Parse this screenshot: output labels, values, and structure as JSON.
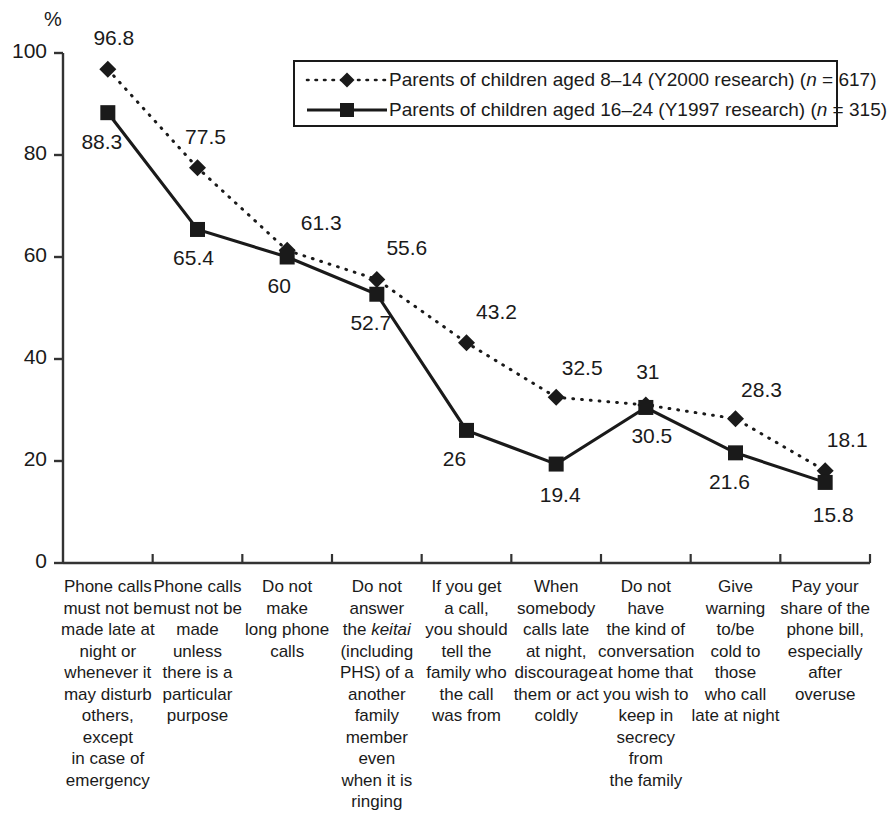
{
  "chart_data": {
    "type": "line",
    "title": "",
    "xlabel": "",
    "ylabel": "%",
    "ylim": [
      0,
      100
    ],
    "ytick_labels": [
      "0",
      "20",
      "40",
      "60",
      "80",
      "100"
    ],
    "ytick_values": [
      0,
      20,
      40,
      60,
      80,
      100
    ],
    "grid": false,
    "legend_position": "top-right",
    "categories": [
      "Phone calls must not be made late at night or whenever it may disturb others, except in case of emergency",
      "Phone calls must not be made unless there is a particular purpose",
      "Do not make long phone calls",
      "Do not answer the keitai (including PHS) of a another family member even when it is ringing",
      "If you get a call, you should tell the family who the call was from",
      "When somebody calls late at night, discourage them or act coldly",
      "Do not have the kind of conversation at home that you wish to keep in secrecy from the family",
      "Give warning to/be cold to those who call late at night",
      "Pay your share of the phone bill, especially after overuse"
    ],
    "category_lines": [
      [
        "Phone calls",
        "must not be",
        "made late at",
        "night or",
        "whenever it",
        "may disturb",
        "others, except",
        "in case of",
        "emergency"
      ],
      [
        "Phone calls",
        "must not be",
        "made",
        "unless",
        "there is a",
        "particular",
        "purpose"
      ],
      [
        "Do not",
        "make",
        "long phone",
        "calls"
      ],
      [
        "Do not answer",
        "the $keitai$",
        "(including",
        "PHS) of a",
        "another family",
        "member even",
        "when it is",
        "ringing"
      ],
      [
        "If you get",
        "a call,",
        "you should",
        "tell the",
        "family who",
        "the call",
        "was from"
      ],
      [
        "When",
        "somebody",
        "calls late",
        "at night,",
        "discourage",
        "them or act",
        "coldly"
      ],
      [
        "Do not",
        "have",
        "the kind of",
        "conversation",
        "at home that",
        "you wish to",
        "keep in",
        "secrecy from",
        "the family"
      ],
      [
        "Give",
        "warning",
        "to/be",
        "cold to",
        "those",
        "who call",
        "late at night"
      ],
      [
        "Pay your",
        "share of the",
        "phone bill,",
        "especially",
        "after overuse"
      ]
    ],
    "series": [
      {
        "name": "Parents of children aged 8–14 (Y2000 research) (n = 617)",
        "name_prefix": "Parents of children aged 8–14 (Y2000 research) (",
        "name_italic": "n",
        "name_suffix": " = 617)",
        "marker": "diamond",
        "line_style": "dotted",
        "color": "#1a1a1a",
        "values": [
          96.8,
          77.5,
          61.3,
          55.6,
          43.2,
          32.5,
          31,
          28.3,
          18.1
        ],
        "value_labels": [
          "96.8",
          "77.5",
          "61.3",
          "55.6",
          "43.2",
          "32.5",
          "31",
          "28.3",
          "18.1"
        ]
      },
      {
        "name": "Parents of children aged 16–24 (Y1997 research) (n = 315)",
        "name_prefix": "Parents of children aged 16–24 (Y1997 research) (",
        "name_italic": "n",
        "name_suffix": " = 315)",
        "marker": "square",
        "line_style": "solid",
        "color": "#1a1a1a",
        "values": [
          88.3,
          65.4,
          60,
          52.7,
          26,
          19.4,
          30.5,
          21.6,
          15.8
        ],
        "value_labels": [
          "88.3",
          "65.4",
          "60",
          "52.7",
          "26",
          "19.4",
          "30.5",
          "21.6",
          "15.8"
        ]
      }
    ]
  },
  "axis": {
    "unit_label": "%"
  }
}
